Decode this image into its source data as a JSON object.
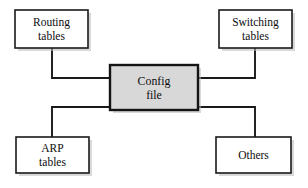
{
  "diagram": {
    "type": "node-link block diagram",
    "background_color": "#ffffff",
    "line_color": "#1a1a1a",
    "box_fill": "#ffffff",
    "center_box_fill": "#d8d8d8",
    "shadow_color": "#b9b9b9",
    "nodes": [
      {
        "id": "routing-tables",
        "line1": "Routing",
        "line2": "tables",
        "position": "top-left",
        "emphasis": "normal"
      },
      {
        "id": "switching-tables",
        "line1": "Switching",
        "line2": "tables",
        "position": "top-right",
        "emphasis": "normal"
      },
      {
        "id": "config-file",
        "line1": "Config",
        "line2": "file",
        "position": "center",
        "emphasis": "shaded"
      },
      {
        "id": "arp-tables",
        "line1": "ARP",
        "line2": "tables",
        "position": "bottom-left",
        "emphasis": "normal"
      },
      {
        "id": "others",
        "line1": "Others",
        "line2": "",
        "position": "bottom-right",
        "emphasis": "normal"
      }
    ],
    "edges": [
      {
        "id": "edge-routing",
        "from": "routing-tables",
        "to": "config-file"
      },
      {
        "id": "edge-switching",
        "from": "switching-tables",
        "to": "config-file"
      },
      {
        "id": "edge-arp",
        "from": "config-file",
        "to": "arp-tables"
      },
      {
        "id": "edge-others",
        "from": "config-file",
        "to": "others"
      }
    ]
  }
}
